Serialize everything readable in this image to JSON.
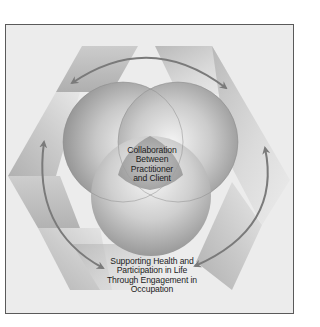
{
  "diagram": {
    "title": "",
    "center_label": {
      "lines": [
        "Collaboration",
        "Between",
        "Practitioner",
        "and Client"
      ]
    },
    "bottom_label": {
      "lines": [
        "Supporting Health and",
        "Participation in Life",
        "Through Engagement in",
        "Occupation"
      ]
    },
    "shapes": {
      "circles": 3,
      "hexagon_ribbons": 6,
      "arrows": [
        {
          "name": "top-arrow",
          "direction": "double-headed"
        },
        {
          "name": "left-arrow",
          "direction": "double-headed"
        },
        {
          "name": "right-arrow",
          "direction": "double-headed"
        }
      ]
    },
    "colors": {
      "background": "#ececec",
      "frame_border": "#5a5a5a",
      "ribbon_light": "#d6d6d6",
      "ribbon_dark": "#a9a9a9",
      "sphere_light": "#f4f4f4",
      "sphere_dark": "#8e8e8e",
      "arrow": "#7a7a7a",
      "text": "#1c1c1c"
    }
  }
}
